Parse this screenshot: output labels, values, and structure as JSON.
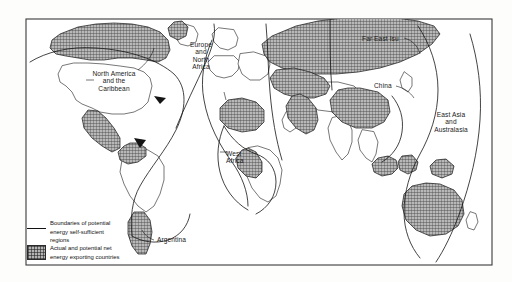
{
  "figure": {
    "type": "thematic-world-map",
    "background_color": "#fdfdfc",
    "frame_color": "#333333",
    "shaded_fill_color": "#b4b4b4",
    "outline_color": "#1a1a1a",
    "boundary_line_color": "#111111"
  },
  "region_labels": [
    {
      "id": "north-america-caribbean",
      "text": "North America\nand the\nCaribbean",
      "x": 101,
      "y": 72
    },
    {
      "id": "europe-north-africa",
      "text": "Europe\nand\nNorth\nAfrica",
      "x": 190,
      "y": 43
    },
    {
      "id": "far-east-su",
      "text": "Far East Isu",
      "x": 363,
      "y": 37
    },
    {
      "id": "east-asia-australasia",
      "text": "East Asia\nand\nAustralasia",
      "x": 432,
      "y": 114
    },
    {
      "id": "west-africa",
      "text": "West\nAfrica",
      "x": 232,
      "y": 153
    }
  ],
  "country_labels": [
    {
      "id": "china",
      "text": "China",
      "x": 375,
      "y": 84
    },
    {
      "id": "argentina",
      "text": "Argentina",
      "x": 163,
      "y": 239
    }
  ],
  "legend": {
    "items": [
      {
        "id": "boundaries",
        "swatch": "line-swatch",
        "text": "Boundaries of potential\nenergy self-sufficient\nregions"
      },
      {
        "id": "exporting-countries",
        "swatch": "hatched-box-swatch",
        "text": "Actual and potential net\nenergy exporting countries"
      }
    ]
  }
}
